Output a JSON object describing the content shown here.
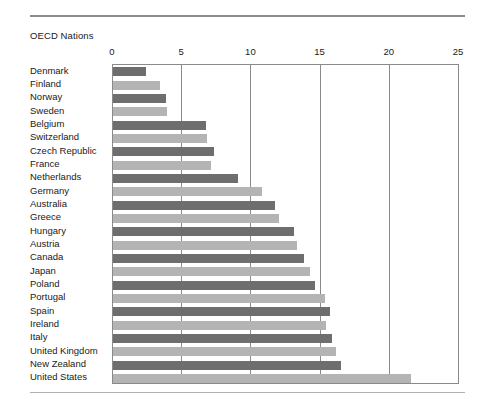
{
  "figure": {
    "title": "OECD Nations",
    "top_rule": "horizontal-rule",
    "bottom_rule": "horizontal-rule"
  },
  "colors": {
    "bar_dark": "#6e6e6e",
    "bar_light": "#b4b4b4",
    "axis": "#8a8a8a",
    "rule": "#8c8c8c",
    "text": "#1a1a1a"
  },
  "chart_data": {
    "type": "bar",
    "orientation": "horizontal",
    "title": "OECD Nations",
    "xlabel": "",
    "ylabel": "",
    "xlim": [
      0,
      25
    ],
    "xticks": [
      0,
      5,
      10,
      15,
      20,
      25
    ],
    "xtick_labels": [
      "0",
      "5",
      "10",
      "15",
      "20",
      "25"
    ],
    "grid": "vertical",
    "legend": "none",
    "categories": [
      "Denmark",
      "Finland",
      "Norway",
      "Sweden",
      "Belgium",
      "Switzerland",
      "Czech Republic",
      "France",
      "Netherlands",
      "Germany",
      "Australia",
      "Greece",
      "Hungary",
      "Austria",
      "Canada",
      "Japan",
      "Poland",
      "Portugal",
      "Spain",
      "Ireland",
      "Italy",
      "United Kingdom",
      "New Zealand",
      "United States"
    ],
    "values": [
      2.4,
      3.4,
      3.8,
      3.9,
      6.7,
      6.8,
      7.3,
      7.1,
      9.0,
      10.8,
      11.7,
      12.0,
      13.1,
      13.3,
      13.8,
      14.2,
      14.6,
      15.3,
      15.7,
      15.4,
      15.8,
      16.1,
      16.5,
      21.5
    ],
    "bar_shades": [
      "dark",
      "light",
      "dark",
      "light",
      "dark",
      "light",
      "dark",
      "light",
      "dark",
      "light",
      "dark",
      "light",
      "dark",
      "light",
      "dark",
      "light",
      "dark",
      "light",
      "dark",
      "light",
      "dark",
      "light",
      "dark",
      "light"
    ]
  }
}
